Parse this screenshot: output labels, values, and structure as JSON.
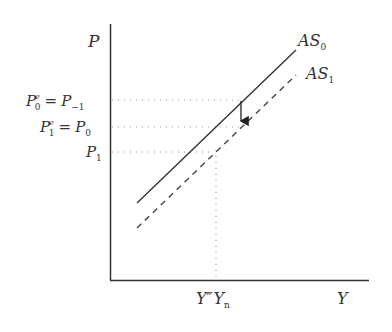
{
  "diagram": {
    "type": "aggregate-supply-shift",
    "axes": {
      "y_label": "P",
      "x_label": "Y"
    },
    "curves": [
      {
        "name": "AS",
        "subscript": "0",
        "style": "solid",
        "color": "#333333"
      },
      {
        "name": "AS",
        "subscript": "1",
        "style": "dashed",
        "color": "#444444"
      }
    ],
    "price_levels": [
      {
        "lhs": "P",
        "lhs_sub": "0",
        "lhs_sup": "e",
        "eq": "=",
        "rhs": "P",
        "rhs_sub": "−1"
      },
      {
        "lhs": "P",
        "lhs_sub": "1",
        "lhs_sup": "e",
        "eq": "=",
        "rhs": "P",
        "rhs_sub": "0"
      },
      {
        "lhs": "P",
        "lhs_sub": "1"
      }
    ],
    "output_labels": {
      "y_double_prime": "Y″",
      "y_n": "Y",
      "y_n_sub": "n"
    },
    "arrow": {
      "direction": "down",
      "meaning": "shift from AS0 to AS1"
    },
    "colors": {
      "axis": "#333333",
      "dotted": "#999999",
      "text": "#333333"
    }
  }
}
